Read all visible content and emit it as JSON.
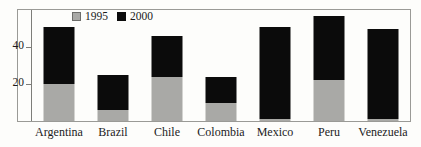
{
  "chart_data": {
    "type": "bar",
    "subtype": "stacked-bar",
    "title": "",
    "xlabel": "",
    "ylabel": "",
    "categories": [
      "Argentina",
      "Brazil",
      "Chile",
      "Colombia",
      "Mexico",
      "Peru",
      "Venezuela"
    ],
    "series": [
      {
        "name": "1995",
        "color": "#a9a9a6",
        "values": [
          20,
          6,
          24,
          10,
          1,
          22,
          1
        ]
      },
      {
        "name": "2000",
        "color": "#0b0b0b",
        "values": [
          51,
          25,
          46,
          24,
          51,
          57,
          50
        ]
      }
    ],
    "stacking_note": "2000 values are cumulative bar tops; black segment is drawn above the gray 1995 segment",
    "ylim": [
      0,
      60
    ],
    "yticks": [
      20,
      40
    ],
    "ytick_labels": [
      "20",
      "40"
    ],
    "grid": false,
    "legend_position": "top-left-inside",
    "legend_entries": [
      "1995",
      "2000"
    ]
  },
  "legend": {
    "items": [
      {
        "label": "1995",
        "swatch": "gray-swatch-icon"
      },
      {
        "label": "2000",
        "swatch": "black-swatch-icon"
      }
    ]
  },
  "yaxis": {
    "ticks": [
      {
        "label": "40",
        "value": 40
      },
      {
        "label": "20",
        "value": 20
      }
    ]
  },
  "xaxis": {
    "labels": [
      "Argentina",
      "Brazil",
      "Chile",
      "Colombia",
      "Mexico",
      "Peru",
      "Venezuela"
    ]
  }
}
